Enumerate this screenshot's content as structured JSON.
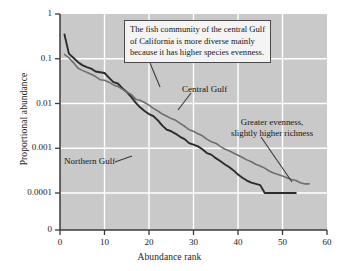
{
  "chart_data": {
    "type": "line",
    "title": "",
    "xlabel": "Abundance rank",
    "ylabel": "Proportional abundance",
    "xlim": [
      0,
      60
    ],
    "ylim_log": [
      0.0001,
      1
    ],
    "xticks": [
      "0",
      "10",
      "20",
      "30",
      "40",
      "50",
      "60"
    ],
    "xtick_values": [
      0,
      10,
      20,
      30,
      40,
      50,
      60
    ],
    "yticks": [
      "1",
      "0.1",
      "0.01",
      "0.001",
      "0.0001",
      "0"
    ],
    "ytick_values": [
      1,
      0.1,
      0.01,
      0.001,
      0.0001,
      0
    ],
    "grid": true,
    "grid_color": "#ffffff",
    "plot_background": "#c9c9c9",
    "legend_position": "inline-labels",
    "series": [
      {
        "name": "Northern Gulf",
        "color": "#2b2b2b",
        "x": [
          1,
          2,
          3,
          4,
          5,
          6,
          7,
          8,
          9,
          10,
          11,
          12,
          13,
          14,
          15,
          16,
          17,
          18,
          19,
          20,
          21,
          22,
          23,
          24,
          25,
          26,
          27,
          28,
          29,
          30,
          31,
          32,
          33,
          34,
          35,
          36,
          37,
          38,
          39,
          40,
          41,
          42,
          43,
          44,
          45,
          46,
          47,
          48,
          49,
          50,
          51,
          52,
          53
        ],
        "values": [
          0.35,
          0.13,
          0.105,
          0.085,
          0.072,
          0.065,
          0.06,
          0.052,
          0.05,
          0.048,
          0.038,
          0.03,
          0.028,
          0.022,
          0.018,
          0.014,
          0.0105,
          0.0082,
          0.0068,
          0.0058,
          0.0052,
          0.0042,
          0.0032,
          0.0026,
          0.0024,
          0.0021,
          0.0018,
          0.0016,
          0.0013,
          0.0012,
          0.0011,
          0.00095,
          0.00078,
          0.00072,
          0.0006,
          0.00052,
          0.00044,
          0.00038,
          0.00032,
          0.00026,
          0.00022,
          0.00019,
          0.00017,
          0.00016,
          0.00015,
          0.0001,
          0.0001,
          0.0001,
          0.0001,
          0.0001,
          0.0001,
          0.0001,
          0.0001
        ]
      },
      {
        "name": "Central Gulf",
        "color": "#6e6e6e",
        "x": [
          1,
          2,
          3,
          4,
          5,
          6,
          7,
          8,
          9,
          10,
          11,
          12,
          13,
          14,
          15,
          16,
          17,
          18,
          19,
          20,
          21,
          22,
          23,
          24,
          25,
          26,
          27,
          28,
          29,
          30,
          31,
          32,
          33,
          34,
          35,
          36,
          37,
          38,
          39,
          40,
          41,
          42,
          43,
          44,
          45,
          46,
          47,
          48,
          49,
          50,
          51,
          52,
          53,
          54,
          55,
          56
        ],
        "values": [
          0.125,
          0.105,
          0.082,
          0.062,
          0.055,
          0.05,
          0.045,
          0.04,
          0.034,
          0.033,
          0.03,
          0.026,
          0.024,
          0.021,
          0.018,
          0.016,
          0.0125,
          0.0118,
          0.0105,
          0.0092,
          0.0078,
          0.0068,
          0.0058,
          0.0052,
          0.0046,
          0.0042,
          0.0036,
          0.0031,
          0.0026,
          0.0024,
          0.0021,
          0.0019,
          0.0016,
          0.0014,
          0.0013,
          0.0011,
          0.00096,
          0.00088,
          0.00078,
          0.0007,
          0.00062,
          0.00055,
          0.0005,
          0.00044,
          0.0004,
          0.00036,
          0.00031,
          0.00028,
          0.00026,
          0.00024,
          0.00022,
          0.0002,
          0.00019,
          0.00017,
          0.00016,
          0.00016
        ]
      }
    ],
    "annotations": [
      {
        "id": "callout",
        "lines": [
          "The fish community of the central Gulf",
          "of California is more diverse mainly",
          "because it has higher species evenness."
        ]
      },
      {
        "id": "note-right",
        "lines": [
          "Greater evenness,",
          "slightly higher richness"
        ]
      }
    ]
  },
  "labels": {
    "northern_gulf": "Northern Gulf",
    "central_gulf": "Central Gulf",
    "callout_line1": "The fish community of the central Gulf",
    "callout_line2": "of California is more diverse mainly",
    "callout_line3": "because it has higher species evenness.",
    "note_line1": "Greater evenness,",
    "note_line2": "slightly higher richness"
  },
  "axes": {
    "x_title": "Abundance rank",
    "y_title": "Proportional abundance",
    "x_ticks": [
      "0",
      "10",
      "20",
      "30",
      "40",
      "50",
      "60"
    ],
    "y_ticks": [
      "1",
      "0.1",
      "0.01",
      "0.001",
      "0.0001",
      "0"
    ]
  },
  "colors": {
    "plot_bg": "#c9c9c9",
    "grid": "#ffffff",
    "northern": "#2b2b2b",
    "central": "#6e6e6e",
    "axis": "#3a3a3a"
  }
}
